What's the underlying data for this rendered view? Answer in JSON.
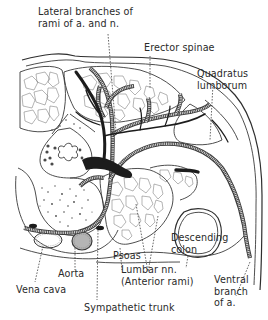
{
  "figure": {
    "type": "anatomical cross-section"
  },
  "labels": {
    "lateral_branches": {
      "line1": "Lateral branches of",
      "line2": "rami of a. and n."
    },
    "erector_spinae": {
      "line1": "Erector spinae"
    },
    "quadratus_lumborum": {
      "line1": "Quadratus",
      "line2": "lumborum"
    },
    "psoas": {
      "line1": "Psoas"
    },
    "descending_colon": {
      "line1": "Descending",
      "line2": "colon"
    },
    "aorta": {
      "line1": "Aorta"
    },
    "lumbar_nn": {
      "line1": "Lumbar nn.",
      "line2": "(Anterior rami)"
    },
    "vena_cava": {
      "line1": "Vena cava"
    },
    "ventral_branch": {
      "line1": "Ventral",
      "line2": "branch",
      "line3": "of a."
    },
    "sympathetic_trunk": {
      "line1": "Sympathetic trunk"
    }
  },
  "colors": {
    "line": "#3a3a3a",
    "nerve_fill": "#1c1c1c",
    "aorta_fill": "#b5b5b5",
    "background": "#ffffff"
  }
}
